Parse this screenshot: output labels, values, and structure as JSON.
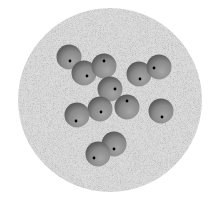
{
  "image": {
    "width": 216,
    "height": 202,
    "background": "#ffffff"
  },
  "disk": {
    "cx": 110,
    "cy": 100,
    "r": 92,
    "fill": "#d6d6d6",
    "noise_light": "#ececec",
    "noise_dark": "#bdbdbd"
  },
  "sphere_style": {
    "r": 12.5,
    "highlight": "#a6a6a6",
    "mid": "#8a8a8a",
    "shadow": "#4e4e4e",
    "dot_color": "#000000",
    "dot_r": 1.4
  },
  "spheres": [
    {
      "cx": 69,
      "cy": 57,
      "dx": 70,
      "dy": 61
    },
    {
      "cx": 84,
      "cy": 73,
      "dx": 87,
      "dy": 76
    },
    {
      "cx": 104,
      "cy": 66,
      "dx": 104,
      "dy": 61
    },
    {
      "cx": 139,
      "cy": 74,
      "dx": 140,
      "dy": 79
    },
    {
      "cx": 159,
      "cy": 67,
      "dx": 154,
      "dy": 68
    },
    {
      "cx": 110,
      "cy": 89,
      "dx": 115,
      "dy": 89
    },
    {
      "cx": 100,
      "cy": 109,
      "dx": 101,
      "dy": 112
    },
    {
      "cx": 127,
      "cy": 107,
      "dx": 127,
      "dy": 101
    },
    {
      "cx": 77,
      "cy": 115,
      "dx": 76,
      "dy": 121
    },
    {
      "cx": 161,
      "cy": 111,
      "dx": 162,
      "dy": 117
    },
    {
      "cx": 114,
      "cy": 144,
      "dx": 114,
      "dy": 149
    },
    {
      "cx": 98,
      "cy": 154,
      "dx": 94,
      "dy": 158
    }
  ]
}
